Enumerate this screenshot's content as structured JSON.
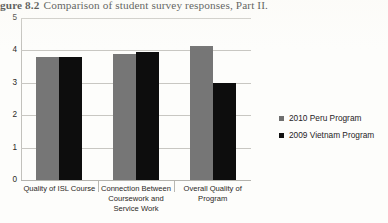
{
  "caption": {
    "number": "gure 8.2",
    "text": "Comparison of student survey responses, Part II."
  },
  "chart_data": {
    "type": "bar",
    "title": "Comparison of student survey responses, Part II.",
    "xlabel": "",
    "ylabel": "",
    "ylim": [
      0,
      5
    ],
    "yticks": [
      "0",
      "1",
      "2",
      "3",
      "4",
      "5"
    ],
    "grid": true,
    "legend_position": "right",
    "categories": [
      "Quality of ISL Course",
      "Connection Between Coursework and Service Work",
      "Overall Quality of Program"
    ],
    "series": [
      {
        "name": "2010 Peru Program",
        "color": "#767676",
        "values": [
          3.8,
          3.9,
          4.15
        ]
      },
      {
        "name": "2009 Vietnam Program",
        "color": "#0d0d0d",
        "values": [
          3.8,
          3.95,
          3.0
        ]
      }
    ]
  },
  "legend": {
    "items": [
      {
        "label": "2010 Peru Program"
      },
      {
        "label": "2009 Vietnam Program"
      }
    ]
  }
}
